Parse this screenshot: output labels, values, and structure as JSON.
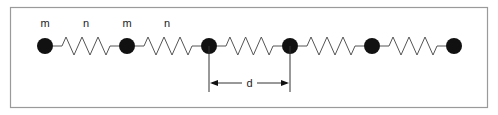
{
  "diagram": {
    "mass_label": "m",
    "spring_label": "n",
    "distance_label": "d",
    "mass_count": 6,
    "colors": {
      "border": "#9a9a9a",
      "mass": "#111111",
      "spring": "#555555"
    }
  }
}
